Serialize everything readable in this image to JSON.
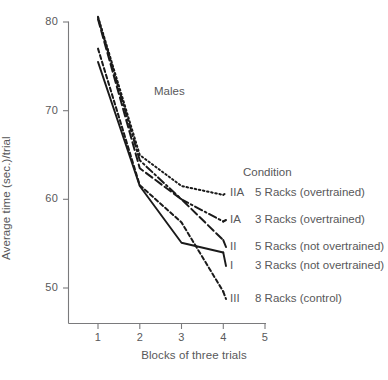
{
  "chart_data": {
    "type": "line",
    "title": "",
    "annotation": "Males",
    "xlabel": "Blocks of three trials",
    "ylabel": "Average time (sec.)/trial",
    "xlim": [
      0.45,
      5.2
    ],
    "ylim": [
      45.5,
      82.5
    ],
    "xticks": [
      1,
      2,
      3,
      4,
      5
    ],
    "xtick_labels": [
      "1",
      "2",
      "3",
      "4",
      "5"
    ],
    "yticks": [
      50,
      60,
      70,
      80
    ],
    "ytick_labels": [
      "50",
      "60",
      "70",
      "80"
    ],
    "grid": false,
    "legend_position": "right",
    "legend_title": "Condition",
    "x": [
      1,
      2,
      3,
      4
    ],
    "series": [
      {
        "name": "IIA 5 Racks (overtrained)",
        "code": "IIA",
        "description": "5 Racks (overtrained)",
        "style": "dotted",
        "color": "#1a1a1a",
        "values": [
          80.6,
          65.0,
          61.5,
          60.5
        ]
      },
      {
        "name": "IA 3 Racks (overtrained)",
        "code": "IA",
        "description": "3 Racks (overtrained)",
        "style": "dash-dot",
        "color": "#1a1a1a",
        "values": [
          80.5,
          64.4,
          60.0,
          57.5
        ]
      },
      {
        "name": "II 5 Racks (not overtrained)",
        "code": "II",
        "description": "5 Racks (not overtrained)",
        "style": "long-dash",
        "color": "#1a1a1a",
        "values": [
          80.3,
          63.5,
          60.0,
          55.4
        ]
      },
      {
        "name": "I 3 Racks (not overtrained)",
        "code": "I",
        "description": "3 Racks (not overtrained)",
        "style": "solid",
        "color": "#1a1a1a",
        "values": [
          75.5,
          61.5,
          55.1,
          54.0
        ]
      },
      {
        "name": "III 8 Racks (control)",
        "code": "III",
        "description": "8 Racks (control)",
        "style": "dashed",
        "color": "#1a1a1a",
        "values": [
          77.0,
          61.6,
          57.4,
          49.6
        ]
      }
    ],
    "axis_color": "#7a7a7c",
    "text_color": "#58585a",
    "background": "#ffffff"
  },
  "legend": {
    "title": "Condition",
    "entries": [
      {
        "code": "IIA",
        "description": "5 Racks (overtrained)"
      },
      {
        "code": "IA",
        "description": "3 Racks (overtrained)"
      },
      {
        "code": "II",
        "description": "5 Racks (not overtrained)"
      },
      {
        "code": "I",
        "description": "3 Racks (not overtrained)"
      },
      {
        "code": "III",
        "description": "8 Racks (control)"
      }
    ]
  }
}
